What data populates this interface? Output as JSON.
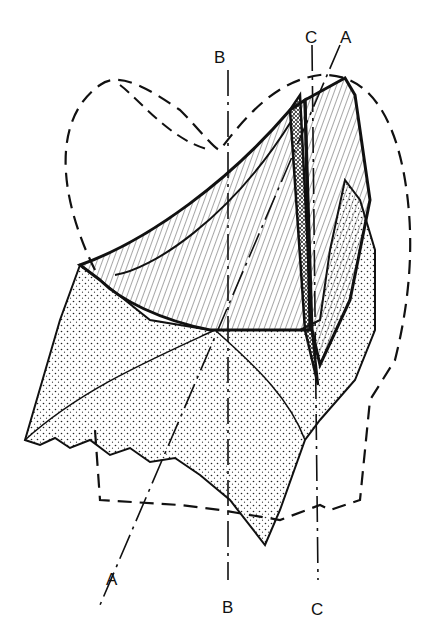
{
  "diagram": {
    "labels": {
      "A_top": "A",
      "A_bottom": "A",
      "B_top": "B",
      "B_bottom": "B",
      "C_top": "C",
      "C_bottom": "C"
    },
    "colors": {
      "ink": "#111111",
      "paper": "#ffffff"
    }
  }
}
